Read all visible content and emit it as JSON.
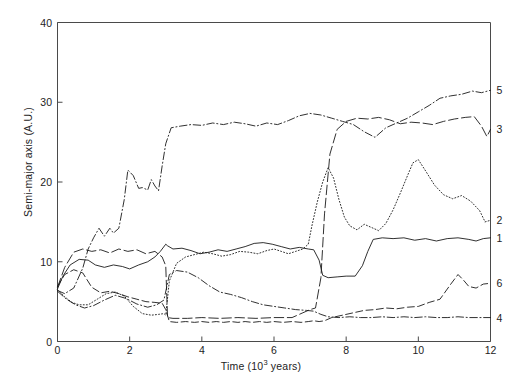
{
  "chart_data": {
    "type": "line",
    "title": "",
    "xlabel": "Time (10³ years)",
    "xlabel_prefix": "Time (10",
    "xlabel_sup": "3",
    "xlabel_suffix": " years)",
    "ylabel": "Semi-major axis (A.U.)",
    "xlim": [
      0,
      12
    ],
    "ylim": [
      0,
      40
    ],
    "xticks": [
      0,
      2,
      4,
      6,
      8,
      10,
      12
    ],
    "xtick_labels": [
      "0",
      "2",
      "4",
      "6",
      "8",
      "10",
      "12"
    ],
    "yticks": [
      0,
      10,
      20,
      30,
      40
    ],
    "ytick_labels": [
      "0",
      "10",
      "20",
      "30",
      "40"
    ],
    "grid": false,
    "legend": "right-edge-end-labels",
    "series": [
      {
        "name": "1",
        "label": "1",
        "dash": "solid",
        "end_value": 13.0,
        "x": [
          0,
          0.15,
          0.35,
          0.6,
          0.85,
          1.05,
          1.3,
          1.55,
          1.8,
          2.0,
          2.25,
          2.5,
          2.7,
          2.85,
          3.0,
          3.05,
          3.2,
          3.45,
          3.7,
          3.95,
          4.2,
          4.45,
          4.7,
          4.95,
          5.2,
          5.45,
          5.7,
          5.95,
          6.2,
          6.45,
          6.7,
          6.95,
          7.1,
          7.25,
          7.35,
          7.5,
          7.75,
          8.0,
          8.25,
          8.45,
          8.6,
          8.75,
          9.0,
          9.3,
          9.6,
          9.9,
          10.2,
          10.5,
          10.8,
          11.1,
          11.4,
          11.6,
          11.8,
          12.0
        ],
        "y": [
          6.6,
          8.2,
          9.6,
          10.3,
          10.2,
          9.6,
          9.3,
          9.6,
          9.4,
          9.1,
          9.6,
          10.0,
          10.6,
          11.3,
          12.2,
          12.0,
          11.6,
          11.7,
          11.4,
          11.0,
          11.2,
          11.5,
          11.3,
          11.6,
          11.9,
          12.3,
          12.4,
          12.2,
          11.9,
          11.6,
          11.8,
          11.6,
          11.5,
          10.2,
          8.3,
          8.0,
          8.1,
          8.2,
          8.2,
          9.5,
          11.3,
          12.8,
          13.0,
          12.9,
          13.0,
          12.7,
          12.9,
          12.6,
          12.9,
          13.0,
          12.8,
          12.6,
          12.9,
          13.0
        ]
      },
      {
        "name": "2",
        "label": "2",
        "dash": "dotted",
        "end_value": 15.2,
        "x": [
          0,
          0.2,
          0.4,
          0.6,
          0.85,
          1.1,
          1.35,
          1.6,
          1.85,
          2.1,
          2.35,
          2.6,
          2.8,
          2.95,
          3.0,
          3.1,
          3.3,
          3.55,
          3.8,
          4.05,
          4.3,
          4.55,
          4.8,
          5.05,
          5.3,
          5.55,
          5.8,
          6.0,
          6.2,
          6.4,
          6.6,
          6.8,
          6.95,
          7.05,
          7.2,
          7.35,
          7.5,
          7.65,
          7.8,
          7.95,
          8.1,
          8.3,
          8.5,
          8.7,
          8.9,
          9.1,
          9.3,
          9.5,
          9.7,
          9.85,
          10.0,
          10.2,
          10.45,
          10.7,
          10.95,
          11.2,
          11.45,
          11.7,
          11.85,
          12.0
        ],
        "y": [
          6.5,
          5.6,
          4.9,
          4.6,
          4.6,
          5.3,
          6.0,
          6.2,
          5.7,
          4.4,
          3.5,
          3.3,
          3.4,
          3.5,
          3.3,
          7.6,
          9.8,
          10.6,
          10.9,
          11.2,
          11.0,
          10.7,
          10.9,
          11.3,
          11.2,
          11.0,
          11.4,
          11.6,
          11.3,
          11.0,
          11.3,
          11.6,
          12.2,
          14.5,
          17.5,
          20.0,
          21.8,
          20.5,
          17.8,
          15.6,
          14.5,
          14.0,
          14.7,
          14.3,
          13.9,
          14.8,
          16.5,
          18.6,
          20.8,
          22.4,
          22.8,
          21.4,
          19.6,
          18.4,
          17.9,
          18.3,
          17.6,
          16.4,
          15.0,
          15.2
        ]
      },
      {
        "name": "3",
        "label": "3",
        "dash": "longdash",
        "end_value": 26.6,
        "x": [
          0,
          0.2,
          0.45,
          0.7,
          0.95,
          1.2,
          1.45,
          1.7,
          1.95,
          2.2,
          2.45,
          2.7,
          2.9,
          3.0,
          3.05,
          3.2,
          3.6,
          4.0,
          4.5,
          5.0,
          5.5,
          6.0,
          6.5,
          6.8,
          7.0,
          7.15,
          7.3,
          7.4,
          7.55,
          7.75,
          8.0,
          8.3,
          8.6,
          8.9,
          9.2,
          9.5,
          9.8,
          10.1,
          10.4,
          10.7,
          11.0,
          11.3,
          11.55,
          11.75,
          11.9,
          12.0
        ],
        "y": [
          6.8,
          9.3,
          11.2,
          11.6,
          11.3,
          11.5,
          11.1,
          11.6,
          11.3,
          11.5,
          11.0,
          11.3,
          10.6,
          9.5,
          3.0,
          2.9,
          2.9,
          3.0,
          2.9,
          3.0,
          2.9,
          3.0,
          3.0,
          3.6,
          4.0,
          4.2,
          8.0,
          16.0,
          23.5,
          26.6,
          27.6,
          28.0,
          27.9,
          28.1,
          27.8,
          27.3,
          27.5,
          27.4,
          27.2,
          27.6,
          27.9,
          28.1,
          28.2,
          27.0,
          25.7,
          26.6
        ]
      },
      {
        "name": "4",
        "label": "4",
        "dash": "dashdot",
        "end_value": 3.0,
        "x": [
          0,
          0.25,
          0.5,
          0.75,
          1.0,
          1.3,
          1.6,
          1.9,
          2.2,
          2.5,
          2.75,
          2.95,
          3.1,
          3.3,
          3.6,
          3.9,
          4.2,
          4.5,
          4.8,
          5.1,
          5.4,
          5.7,
          6.0,
          6.3,
          6.6,
          6.9,
          7.1,
          7.3,
          7.5,
          7.8,
          8.1,
          8.4,
          8.7,
          9.0,
          9.3,
          9.6,
          9.9,
          10.2,
          10.5,
          10.8,
          11.1,
          11.4,
          11.7,
          12.0
        ],
        "y": [
          6.3,
          5.3,
          4.6,
          4.2,
          4.5,
          5.2,
          5.8,
          5.4,
          4.7,
          4.3,
          4.6,
          5.2,
          8.4,
          8.9,
          8.7,
          8.0,
          7.0,
          6.2,
          5.9,
          5.5,
          5.0,
          4.6,
          4.4,
          4.2,
          4.0,
          3.9,
          3.8,
          3.4,
          3.1,
          3.0,
          3.1,
          3.0,
          3.0,
          3.1,
          3.0,
          3.1,
          3.0,
          3.1,
          3.0,
          3.0,
          3.1,
          3.0,
          3.0,
          3.0
        ]
      },
      {
        "name": "5",
        "label": "5",
        "dash": "dashdot",
        "end_value": 31.5,
        "x": [
          0,
          0.2,
          0.45,
          0.7,
          0.85,
          1.0,
          1.15,
          1.3,
          1.45,
          1.55,
          1.7,
          1.85,
          1.95,
          2.1,
          2.25,
          2.35,
          2.5,
          2.6,
          2.7,
          2.8,
          2.9,
          3.0,
          3.15,
          3.4,
          3.7,
          4.0,
          4.3,
          4.6,
          4.9,
          5.2,
          5.5,
          5.8,
          6.1,
          6.4,
          6.7,
          7.0,
          7.3,
          7.6,
          7.9,
          8.2,
          8.5,
          8.8,
          9.1,
          9.4,
          9.7,
          10.0,
          10.3,
          10.6,
          10.9,
          11.2,
          11.5,
          11.75,
          12.0
        ],
        "y": [
          6.4,
          6.0,
          6.7,
          9.2,
          11.6,
          13.0,
          14.2,
          13.2,
          14.2,
          13.6,
          14.2,
          17.8,
          21.5,
          20.8,
          19.2,
          19.3,
          19.0,
          20.3,
          19.5,
          18.9,
          22.0,
          24.8,
          26.8,
          27.0,
          27.2,
          27.1,
          27.4,
          27.2,
          27.5,
          27.3,
          27.0,
          27.4,
          27.2,
          27.7,
          28.3,
          28.6,
          28.4,
          28.0,
          27.6,
          27.2,
          26.3,
          25.6,
          26.8,
          27.4,
          28.0,
          28.8,
          29.6,
          30.5,
          30.8,
          31.0,
          31.4,
          31.2,
          31.5
        ]
      },
      {
        "name": "6",
        "label": "6",
        "dash": "dashed",
        "end_value": 7.3,
        "x": [
          0,
          0.2,
          0.45,
          0.7,
          0.95,
          1.2,
          1.45,
          1.7,
          1.95,
          2.2,
          2.45,
          2.7,
          2.9,
          3.0,
          3.1,
          3.3,
          3.55,
          3.8,
          4.0,
          4.2,
          4.4,
          4.6,
          4.8,
          5.0,
          5.2,
          5.4,
          5.6,
          5.8,
          6.0,
          6.25,
          6.5,
          6.75,
          6.95,
          7.1,
          7.25,
          7.4,
          7.6,
          7.9,
          8.2,
          8.5,
          8.8,
          9.1,
          9.4,
          9.7,
          10.0,
          10.3,
          10.6,
          10.9,
          11.1,
          11.25,
          11.4,
          11.6,
          11.8,
          12.0
        ],
        "y": [
          6.9,
          8.4,
          9.0,
          8.6,
          6.8,
          6.1,
          6.3,
          6.0,
          5.6,
          5.3,
          5.0,
          4.9,
          4.8,
          4.0,
          2.5,
          2.4,
          2.5,
          2.4,
          2.5,
          2.4,
          2.5,
          2.4,
          2.5,
          2.4,
          2.5,
          2.4,
          2.5,
          2.4,
          2.5,
          2.4,
          2.5,
          2.4,
          2.5,
          2.6,
          2.5,
          2.6,
          3.0,
          3.3,
          3.6,
          3.9,
          4.0,
          4.2,
          4.1,
          4.3,
          4.4,
          4.9,
          5.3,
          7.2,
          8.4,
          7.7,
          6.9,
          6.7,
          7.2,
          7.3
        ]
      }
    ]
  }
}
